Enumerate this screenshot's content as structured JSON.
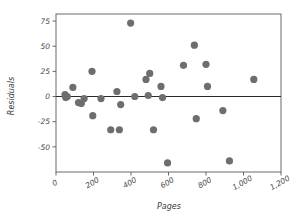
{
  "chart_data": {
    "type": "scatter",
    "title": "",
    "xlabel": "Pages",
    "ylabel": "Residuals",
    "xlim": [
      0,
      1200
    ],
    "ylim": [
      -75,
      82
    ],
    "grid": false,
    "legend": null,
    "xticks": [
      0,
      200,
      400,
      600,
      800,
      1000,
      1200
    ],
    "xticklabels": [
      "0",
      "200",
      "400",
      "600",
      "800",
      "1,000",
      "1,200"
    ],
    "yticks": [
      75,
      50,
      25,
      0,
      -25,
      -50
    ],
    "yticklabels": [
      "75",
      "50",
      "25",
      "0",
      "-25",
      "-50"
    ],
    "marker_color": "#6e6e6e",
    "marker_size": 4.4,
    "reference_line": {
      "y": 0,
      "x_start": 0,
      "x_end": 1200,
      "color": "#2b2b2b"
    },
    "points": [
      {
        "x": 48,
        "y": 2
      },
      {
        "x": 52,
        "y": -1
      },
      {
        "x": 60,
        "y": 0
      },
      {
        "x": 90,
        "y": 9
      },
      {
        "x": 120,
        "y": -6
      },
      {
        "x": 135,
        "y": -7
      },
      {
        "x": 150,
        "y": -2
      },
      {
        "x": 192,
        "y": 25
      },
      {
        "x": 196,
        "y": -19
      },
      {
        "x": 240,
        "y": -2
      },
      {
        "x": 292,
        "y": -33
      },
      {
        "x": 325,
        "y": 5
      },
      {
        "x": 338,
        "y": -33
      },
      {
        "x": 345,
        "y": -8
      },
      {
        "x": 398,
        "y": 73
      },
      {
        "x": 420,
        "y": 0
      },
      {
        "x": 480,
        "y": 17
      },
      {
        "x": 492,
        "y": 1
      },
      {
        "x": 500,
        "y": 23
      },
      {
        "x": 520,
        "y": -33
      },
      {
        "x": 560,
        "y": 10
      },
      {
        "x": 568,
        "y": -1
      },
      {
        "x": 595,
        "y": -66
      },
      {
        "x": 680,
        "y": 31
      },
      {
        "x": 738,
        "y": 51
      },
      {
        "x": 748,
        "y": -22
      },
      {
        "x": 800,
        "y": 32
      },
      {
        "x": 808,
        "y": 10
      },
      {
        "x": 890,
        "y": -14
      },
      {
        "x": 925,
        "y": -64
      },
      {
        "x": 1055,
        "y": 17
      }
    ]
  }
}
